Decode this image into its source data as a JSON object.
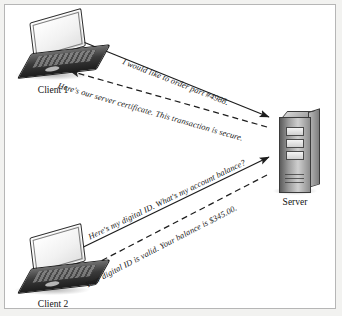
{
  "figure": {
    "background_color": "#ffffff",
    "border_color": "#b6b6b6",
    "page_color": "#f2f2f0"
  },
  "nodes": [
    {
      "id": "client1",
      "label": "Client 1",
      "type": "laptop"
    },
    {
      "id": "client2",
      "label": "Client 2",
      "type": "laptop"
    },
    {
      "id": "server",
      "label": "Server",
      "type": "server-tower"
    }
  ],
  "messages": [
    {
      "id": "msg1",
      "text": "I would like to order part #4988.",
      "from": "client1",
      "to": "server",
      "line_style": "solid",
      "direction": "right"
    },
    {
      "id": "msg2",
      "text": "Here's our server certificate. This transaction is secure.",
      "from": "server",
      "to": "client1",
      "line_style": "dashed",
      "direction": "left"
    },
    {
      "id": "msg3",
      "text": "Here's my digital ID. What's my account balance?",
      "from": "client2",
      "to": "server",
      "line_style": "solid",
      "direction": "right"
    },
    {
      "id": "msg4",
      "text": "Your digital ID is valid. Your balance is $345.00.",
      "from": "server",
      "to": "client2",
      "line_style": "dashed",
      "direction": "left"
    }
  ]
}
